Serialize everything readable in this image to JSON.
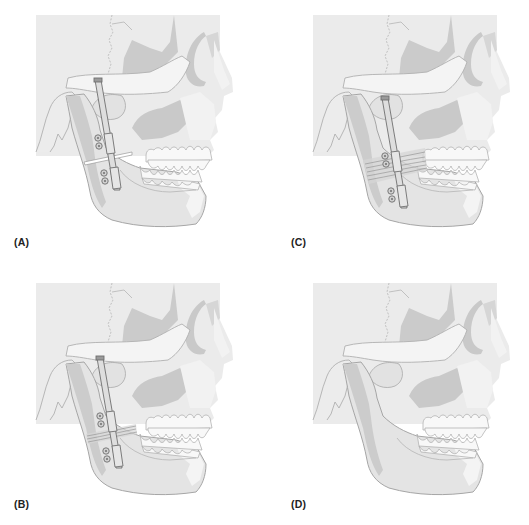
{
  "figure": {
    "colors": {
      "background": "#ffffff",
      "cranium_fill": "#ebebeb",
      "bone_fill": "#e4e4e4",
      "bone_light": "#f3f3f3",
      "shadow_fill": "#c9c9c9",
      "outline": "#a8a8a8",
      "teeth_fill": "#f7f7f7",
      "device_fill": "#dcdcdc",
      "device_outline": "#6f6f6f",
      "callus_lines": "#8d8d8d",
      "label_color": "#222222"
    },
    "panels": [
      {
        "id": "A",
        "label": "(A)",
        "position": "top-left",
        "state": "osteotomy with distractor applied",
        "device": "distractor",
        "gap": "osteotomy-cut",
        "callus": "none"
      },
      {
        "id": "C",
        "label": "(C)",
        "position": "top-right",
        "state": "distraction completed, regenerate forming",
        "device": "distractor",
        "gap": "none",
        "callus": "wide"
      },
      {
        "id": "B",
        "label": "(B)",
        "position": "bottom-left",
        "state": "early distraction, thin regenerate",
        "device": "distractor",
        "gap": "none",
        "callus": "narrow"
      },
      {
        "id": "D",
        "label": "(D)",
        "position": "bottom-right",
        "state": "device removed, lengthened mandible",
        "device": "none",
        "gap": "none",
        "callus": "none"
      }
    ]
  }
}
